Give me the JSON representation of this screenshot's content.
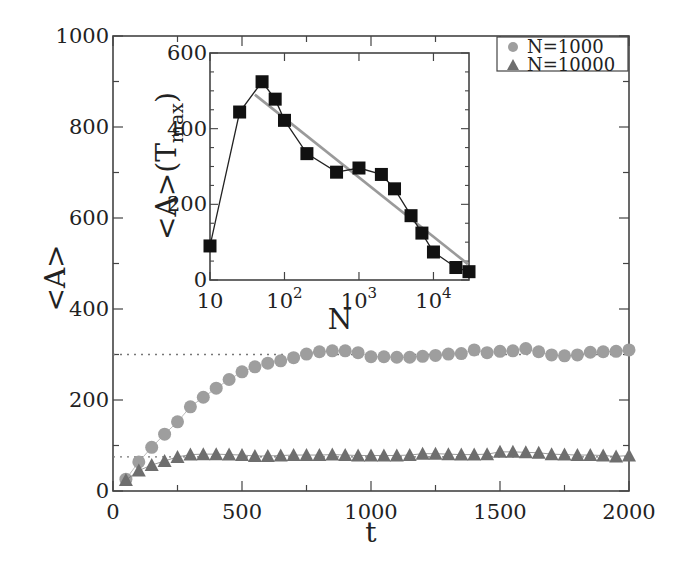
{
  "chart_data": [
    {
      "id": "main",
      "type": "scatter",
      "title": "",
      "xlabel": "t",
      "ylabel": "<A>",
      "xlim": [
        0,
        2000
      ],
      "ylim": [
        0,
        1000
      ],
      "xticks": [
        0,
        500,
        1000,
        1500,
        2000
      ],
      "xtick_labels": [
        "0",
        "500",
        "1000",
        "1500",
        "2000"
      ],
      "yticks": [
        0,
        200,
        400,
        600,
        800,
        1000
      ],
      "ytick_labels": [
        "0",
        "200",
        "400",
        "600",
        "800",
        "1000"
      ],
      "grid": false,
      "legend_position": "upper right",
      "reference_lines": [
        {
          "y": 300,
          "x_range": [
            0,
            2000
          ],
          "style": "dotted"
        },
        {
          "y": 75,
          "x_range": [
            0,
            2000
          ],
          "style": "dotted"
        }
      ],
      "series": [
        {
          "name": "N=1000",
          "marker": "circle",
          "color": "#9e9e9e",
          "x": [
            50,
            100,
            150,
            200,
            250,
            300,
            350,
            400,
            450,
            500,
            550,
            600,
            650,
            700,
            750,
            800,
            850,
            900,
            950,
            1000,
            1050,
            1100,
            1150,
            1200,
            1250,
            1300,
            1350,
            1400,
            1450,
            1500,
            1550,
            1600,
            1650,
            1700,
            1750,
            1800,
            1850,
            1900,
            1950,
            2000
          ],
          "y": [
            26,
            64,
            96,
            125,
            152,
            185,
            206,
            226,
            245,
            262,
            273,
            281,
            286,
            293,
            301,
            306,
            308,
            308,
            304,
            295,
            295,
            294,
            294,
            296,
            298,
            301,
            302,
            310,
            304,
            307,
            308,
            313,
            306,
            299,
            297,
            299,
            305,
            306,
            307,
            310
          ]
        },
        {
          "name": "N=10000",
          "marker": "triangle",
          "color": "#6e6e6e",
          "x": [
            50,
            100,
            150,
            200,
            250,
            300,
            350,
            400,
            450,
            500,
            550,
            600,
            650,
            700,
            750,
            800,
            850,
            900,
            950,
            1000,
            1050,
            1100,
            1150,
            1200,
            1250,
            1300,
            1350,
            1400,
            1450,
            1500,
            1550,
            1600,
            1650,
            1700,
            1750,
            1800,
            1850,
            1900,
            1950,
            2000
          ],
          "y": [
            24,
            45,
            57,
            66,
            75,
            80,
            81,
            81,
            80,
            79,
            77,
            77,
            78,
            79,
            79,
            79,
            80,
            79,
            78,
            78,
            78,
            78,
            79,
            82,
            82,
            81,
            80,
            80,
            81,
            86,
            86,
            85,
            84,
            81,
            80,
            79,
            79,
            78,
            76,
            78
          ]
        }
      ]
    },
    {
      "id": "inset",
      "type": "line",
      "title": "",
      "xlabel": "N",
      "ylabel": "<A>(T_max)",
      "xscale": "log",
      "xlim": [
        10,
        30000
      ],
      "ylim": [
        0,
        600
      ],
      "xticks": [
        10,
        100,
        1000,
        10000
      ],
      "xtick_labels": [
        "10",
        "10^2",
        "10^3",
        "10^4"
      ],
      "yticks": [
        0,
        200,
        400,
        600
      ],
      "ytick_labels": [
        "0",
        "200",
        "400",
        "600"
      ],
      "grid": false,
      "series": [
        {
          "name": "<A>(T_max)",
          "marker": "square",
          "color": "#111111",
          "x": [
            10,
            25,
            50,
            75,
            100,
            200,
            500,
            1000,
            2000,
            3000,
            5000,
            7000,
            10000,
            20000,
            30000
          ],
          "y": [
            90,
            444,
            524,
            478,
            422,
            334,
            285,
            296,
            279,
            241,
            170,
            124,
            74,
            33,
            22
          ]
        },
        {
          "name": "logarithmic fit",
          "marker": "none",
          "color": "#9a9a9a",
          "x": [
            40,
            29000
          ],
          "y": [
            490,
            42
          ]
        }
      ]
    }
  ],
  "legend": {
    "items": [
      {
        "label": "N=1000",
        "marker": "circle",
        "color": "#9e9e9e"
      },
      {
        "label": "N=10000",
        "marker": "triangle",
        "color": "#6e6e6e"
      }
    ]
  },
  "labels": {
    "main_xlabel": "t",
    "main_ylabel": "<A>",
    "inset_xlabel": "N",
    "inset_ylabel_main": "<A>(T",
    "inset_ylabel_sub": "max",
    "inset_ylabel_close": ")"
  }
}
